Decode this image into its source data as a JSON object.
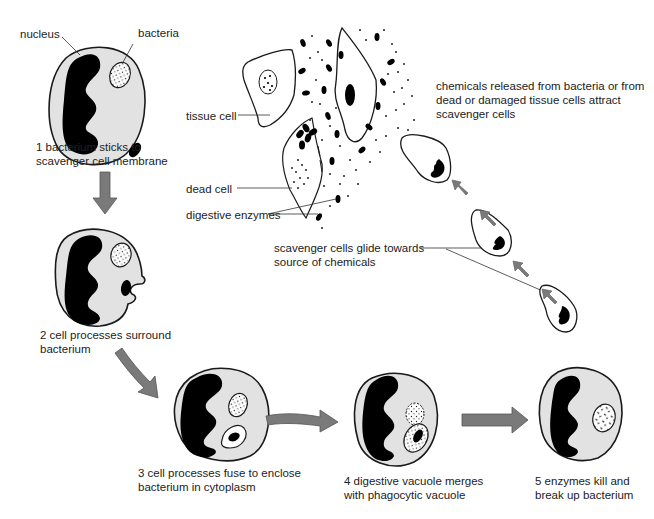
{
  "diagram": {
    "colors": {
      "cell_fill": "#e2e2e2",
      "outline": "#1a1a1a",
      "nucleus": "#000000",
      "arrow": "#7a7a7a",
      "arrow_edge": "#555555",
      "text": "#222222",
      "background": "#ffffff"
    },
    "labels": {
      "nucleus": "nucleus",
      "bacteria": "bacteria",
      "tissue_cell": "tissue cell",
      "dead_cell": "dead cell",
      "digestive_enzymes": "digestive enzymes",
      "chemicals": "chemicals released from bacteria or from\ndead or damaged tissue cells attract\nscavenger cells",
      "glide": "scavenger cells glide towards\nsource of chemicals"
    },
    "steps": [
      {
        "number": 1,
        "caption": "1 bacterium sticks to\nscavenger cell membrane"
      },
      {
        "number": 2,
        "caption": "2 cell processes surround\nbacterium"
      },
      {
        "number": 3,
        "caption": "3 cell processes fuse to enclose\nbacterium in cytoplasm"
      },
      {
        "number": 4,
        "caption": "4 digestive vacuole merges\nwith phagocytic vacuole"
      },
      {
        "number": 5,
        "caption": "5 enzymes kill and\nbreak up bacterium"
      }
    ]
  }
}
